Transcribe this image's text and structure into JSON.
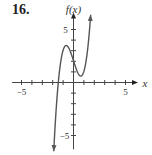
{
  "problem_number": "16.",
  "chart_data": {
    "type": "line",
    "title": "",
    "xlabel": "x",
    "ylabel": "f(x)",
    "xlim": [
      -6,
      6.3
    ],
    "ylim": [
      -6.3,
      6.8
    ],
    "x_tick_labels": [
      "−5",
      "5"
    ],
    "y_tick_labels": [
      "5",
      "−5"
    ],
    "grid": false,
    "legend": null,
    "series": [
      {
        "name": "f(x)",
        "description": "cubic curve with arrows at both ends",
        "x": [
          -1.9,
          -1.6,
          -1.46,
          -1.2,
          -0.7,
          0,
          0.7,
          1.2,
          1.5,
          1.65
        ],
        "y": [
          -6.5,
          -1.6,
          0,
          1.95,
          3.5,
          2.05,
          0.6,
          1.98,
          4.5,
          6.4
        ]
      }
    ],
    "key_points": {
      "local_max": [
        -0.7,
        3.5
      ],
      "local_min": [
        0.7,
        0.6
      ],
      "y_intercept": 2.05,
      "x_intercept": -1.46
    },
    "colors": {
      "curve": "#555555",
      "axes": "#444444"
    }
  }
}
